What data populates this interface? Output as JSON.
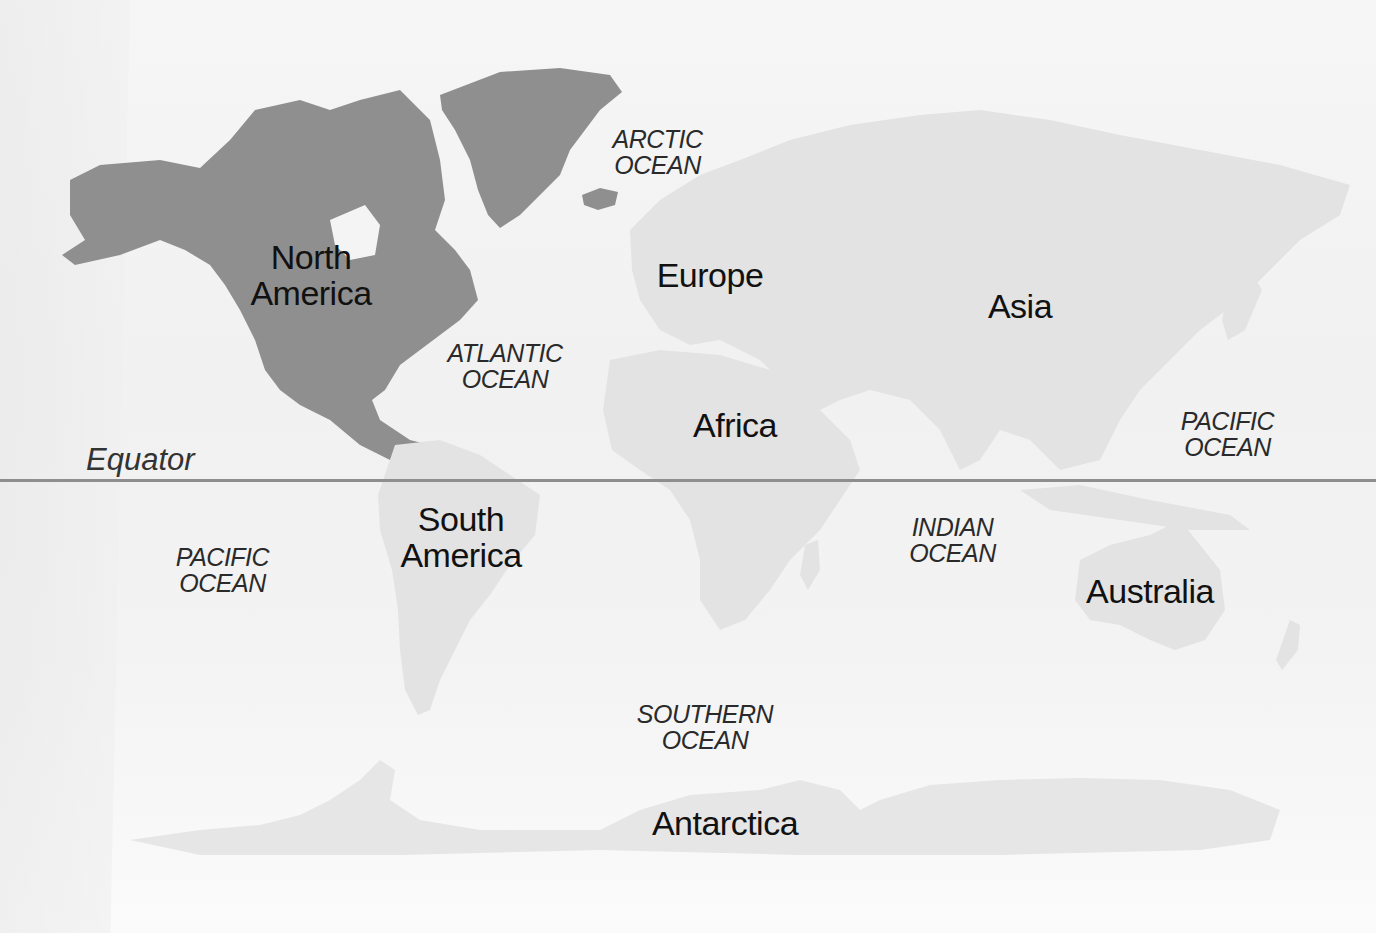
{
  "map": {
    "title": "World map of continents and oceans",
    "colors": {
      "background": "#f4f4f4",
      "north_america_highlight": "#8f8f8f",
      "other_land": "#e3e3e3",
      "equator_line": "#8e8e8e",
      "label_text": "#111111"
    },
    "equator": {
      "label": "Equator"
    },
    "continents": [
      {
        "id": "north-america",
        "label": "North\nAmerica",
        "highlighted": true
      },
      {
        "id": "south-america",
        "label": "South\nAmerica",
        "highlighted": false
      },
      {
        "id": "europe",
        "label": "Europe",
        "highlighted": false
      },
      {
        "id": "africa",
        "label": "Africa",
        "highlighted": false
      },
      {
        "id": "asia",
        "label": "Asia",
        "highlighted": false
      },
      {
        "id": "australia",
        "label": "Australia",
        "highlighted": false
      },
      {
        "id": "antarctica",
        "label": "Antarctica",
        "highlighted": false
      }
    ],
    "oceans": [
      {
        "id": "arctic",
        "label": "ARCTIC\nOCEAN"
      },
      {
        "id": "atlantic",
        "label": "ATLANTIC\nOCEAN"
      },
      {
        "id": "pacific-north",
        "label": "PACIFIC\nOCEAN"
      },
      {
        "id": "pacific-south",
        "label": "PACIFIC\nOCEAN"
      },
      {
        "id": "indian",
        "label": "INDIAN\nOCEAN"
      },
      {
        "id": "southern",
        "label": "SOUTHERN\nOCEAN"
      }
    ]
  }
}
